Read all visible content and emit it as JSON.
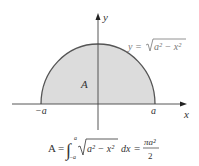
{
  "diagram": {
    "curve_label": "y = √(a² − x²)",
    "curve_label_parts": {
      "lhs": "y =",
      "radicand": "a² − x²"
    },
    "region_label": "A",
    "axis_x_label": "x",
    "axis_y_label": "y",
    "tick_left": "−a",
    "tick_right": "a",
    "formula": {
      "lhs": "A =",
      "integral_lower": "−a",
      "integral_upper": "a",
      "integrand": "a² − x²",
      "dx": "dx",
      "equals": "=",
      "numerator": "πa²",
      "denominator": "2"
    },
    "colors": {
      "fill": "#dcdcdc",
      "curve": "#555555",
      "axis": "#444444",
      "text": "#333333"
    }
  }
}
